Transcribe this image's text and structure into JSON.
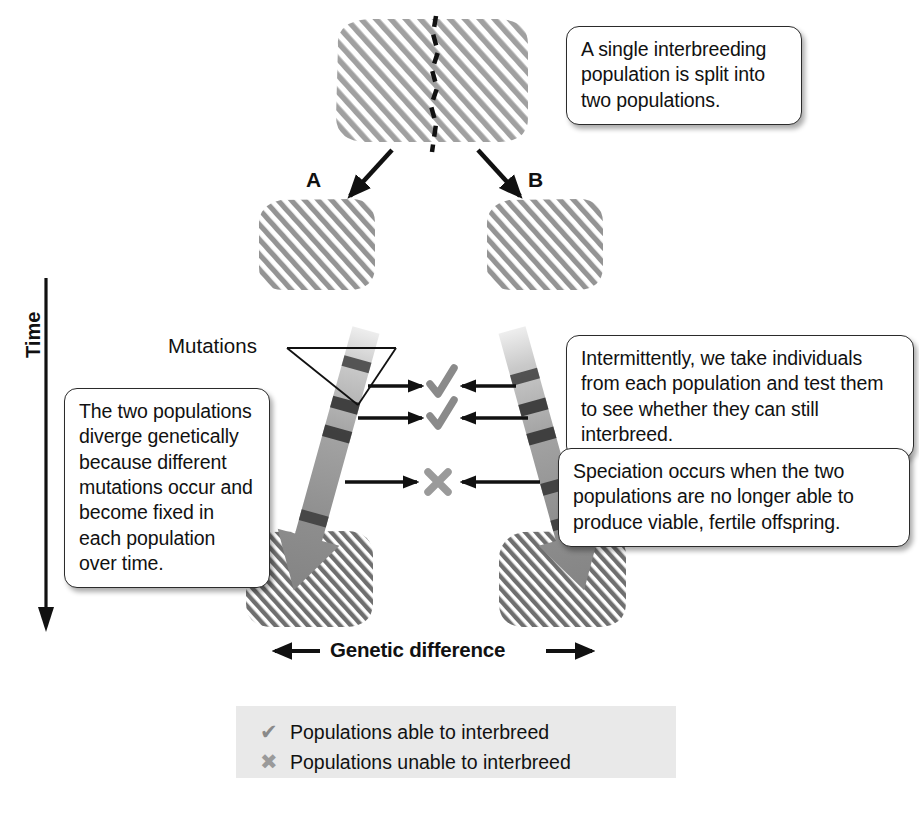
{
  "figure": {
    "title_text_absent": true,
    "axis_labels": {
      "vertical": "Time",
      "horizontal": "Genetic difference"
    }
  },
  "labels": {
    "population_a": "A",
    "population_b": "B",
    "mutations": "Mutations"
  },
  "callouts": [
    {
      "id": "split",
      "text": "A single interbreeding population is split into two populations."
    },
    {
      "id": "test",
      "text": "Intermittently, we take individuals from each population and test them to see whether they can still interbreed."
    },
    {
      "id": "speciation",
      "text": "Speciation occurs when the two populations are no longer able to produce viable, fertile offspring."
    },
    {
      "id": "diverge",
      "text": "The two populations diverge genetically because different mutations occur and become fixed in each population over time."
    }
  ],
  "test_results": [
    {
      "symbol": "check",
      "glyph": "✔",
      "meaning": "able to interbreed"
    },
    {
      "symbol": "check",
      "glyph": "✔",
      "meaning": "able to interbreed"
    },
    {
      "symbol": "cross",
      "glyph": "✖",
      "meaning": "unable to interbreed"
    }
  ],
  "legend": {
    "items": [
      {
        "glyph": "✔",
        "symbol": "check",
        "label": "Populations able to interbreed"
      },
      {
        "glyph": "✖",
        "symbol": "cross",
        "label": "Populations unable to interbreed"
      }
    ]
  },
  "colors": {
    "stripe_light": "#9a9a9a",
    "stripe_dark": "#6e6e6e",
    "arrow_gray": "#8c8c8c",
    "mutation_band": "#3e3e3e",
    "check_gray": "#8a8a8a",
    "cross_gray": "#9a9a9a",
    "legend_bg": "#e9e9e9",
    "ink": "#111111"
  }
}
